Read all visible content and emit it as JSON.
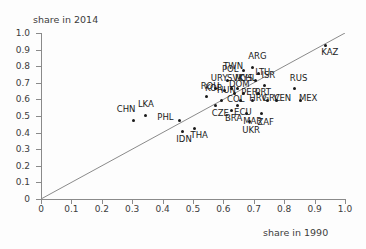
{
  "chart_data": {
    "type": "scatter",
    "title": "",
    "xlabel": "share in 1990",
    "ylabel": "share in 2014",
    "xlim": [
      0,
      1.0
    ],
    "ylim": [
      0,
      1.0
    ],
    "grid": false,
    "legend": null,
    "annotations": [
      "45-degree identity reference line from (0,0) to (1,1)"
    ],
    "xticks": [
      "0",
      "0.1",
      "0.2",
      "0.3",
      "0.4",
      "0.5",
      "0.6",
      "0.7",
      "0.8",
      "0.9",
      "1.0"
    ],
    "yticks": [
      "0",
      "0.1",
      "0.2",
      "0.3",
      "0.4",
      "0.5",
      "0.6",
      "0.7",
      "0.8",
      "0.9",
      "1.0"
    ],
    "point_color": "#1a1a1a",
    "line_color": "#8a8a8a",
    "points": [
      {
        "label": "CHN",
        "x": 0.305,
        "y": 0.475,
        "lx": -17,
        "ly": -11
      },
      {
        "label": "LKA",
        "x": 0.345,
        "y": 0.505,
        "lx": -8,
        "ly": -11
      },
      {
        "label": "PHL",
        "x": 0.455,
        "y": 0.475,
        "lx": -22,
        "ly": -3
      },
      {
        "label": "IDN",
        "x": 0.465,
        "y": 0.405,
        "lx": -6,
        "ly": 7
      },
      {
        "label": "THA",
        "x": 0.505,
        "y": 0.425,
        "lx": -4,
        "ly": 7
      },
      {
        "label": "ROU",
        "x": 0.545,
        "y": 0.615,
        "lx": -6,
        "ly": -11
      },
      {
        "label": "URY",
        "x": 0.575,
        "y": 0.665,
        "lx": -5,
        "ly": -11
      },
      {
        "label": "CZE",
        "x": 0.575,
        "y": 0.565,
        "lx": -4,
        "ly": 8
      },
      {
        "label": "HUN",
        "x": 0.595,
        "y": 0.595,
        "lx": -5,
        "ly": -10
      },
      {
        "label": "KOR",
        "x": 0.605,
        "y": 0.655,
        "lx": -20,
        "ly": -2
      },
      {
        "label": "POL",
        "x": 0.615,
        "y": 0.715,
        "lx": -6,
        "ly": -11
      },
      {
        "label": "SVK",
        "x": 0.625,
        "y": 0.665,
        "lx": -4,
        "ly": -11
      },
      {
        "label": "BRA",
        "x": 0.625,
        "y": 0.535,
        "lx": -6,
        "ly": 8
      },
      {
        "label": "DOM",
        "x": 0.635,
        "y": 0.635,
        "lx": -5,
        "ly": -10
      },
      {
        "label": "MYS",
        "x": 0.645,
        "y": 0.665,
        "lx": -2,
        "ly": -11
      },
      {
        "label": "ECU",
        "x": 0.645,
        "y": 0.565,
        "lx": -3,
        "ly": 7
      },
      {
        "label": "COL",
        "x": 0.655,
        "y": 0.595,
        "lx": -13,
        "ly": -1
      },
      {
        "label": "PER",
        "x": 0.665,
        "y": 0.635,
        "lx": -2,
        "ly": -2
      },
      {
        "label": "TWN",
        "x": 0.665,
        "y": 0.775,
        "lx": -20,
        "ly": -4
      },
      {
        "label": "MAR",
        "x": 0.675,
        "y": 0.515,
        "lx": -3,
        "ly": 7
      },
      {
        "label": "UKR",
        "x": 0.685,
        "y": 0.465,
        "lx": -7,
        "ly": 8
      },
      {
        "label": "HRV",
        "x": 0.695,
        "y": 0.595,
        "lx": -3,
        "ly": -2
      },
      {
        "label": "ARG",
        "x": 0.695,
        "y": 0.795,
        "lx": -4,
        "ly": -11
      },
      {
        "label": "CHL",
        "x": 0.705,
        "y": 0.715,
        "lx": -16,
        "ly": -2
      },
      {
        "label": "LTU",
        "x": 0.715,
        "y": 0.755,
        "lx": -3,
        "ly": -2
      },
      {
        "label": "PRT",
        "x": 0.715,
        "y": 0.635,
        "lx": -3,
        "ly": -2
      },
      {
        "label": "ZAF",
        "x": 0.725,
        "y": 0.515,
        "lx": -4,
        "ly": 8
      },
      {
        "label": "ISR",
        "x": 0.735,
        "y": 0.685,
        "lx": -3,
        "ly": -10
      },
      {
        "label": "GRC",
        "x": 0.745,
        "y": 0.595,
        "lx": -5,
        "ly": -2
      },
      {
        "label": "VEN",
        "x": 0.775,
        "y": 0.595,
        "lx": -3,
        "ly": -2
      },
      {
        "label": "RUS",
        "x": 0.835,
        "y": 0.665,
        "lx": -5,
        "ly": -11
      },
      {
        "label": "MEX",
        "x": 0.855,
        "y": 0.595,
        "lx": -2,
        "ly": -2
      },
      {
        "label": "KAZ",
        "x": 0.935,
        "y": 0.925,
        "lx": -4,
        "ly": 7
      }
    ]
  }
}
